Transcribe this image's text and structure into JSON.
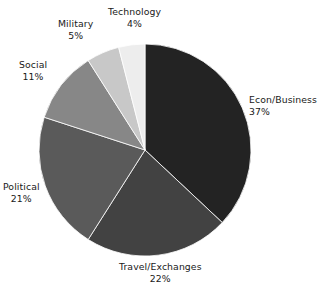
{
  "chart_data": {
    "type": "pie",
    "title": "",
    "categories": [
      "Econ/Business",
      "Travel/Exchanges",
      "Political",
      "Social",
      "Military",
      "Technology"
    ],
    "values": [
      37,
      22,
      21,
      11,
      5,
      4
    ],
    "value_suffix": "%",
    "start_angle_deg": 0,
    "direction": "clockwise",
    "legend": "none",
    "labels_position": "outside",
    "slices": [
      {
        "label": "Econ/Business",
        "value": 37,
        "value_text": "37%",
        "color": "#232323"
      },
      {
        "label": "Travel/Exchanges",
        "value": 22,
        "value_text": "22%",
        "color": "#424242"
      },
      {
        "label": "Political",
        "value": 21,
        "value_text": "21%",
        "color": "#5a5a5a"
      },
      {
        "label": "Social",
        "value": 11,
        "value_text": "11%",
        "color": "#878787"
      },
      {
        "label": "Military",
        "value": 5,
        "value_text": "5%",
        "color": "#c8c8c8"
      },
      {
        "label": "Technology",
        "value": 4,
        "value_text": "4%",
        "color": "#ededed"
      }
    ],
    "geometry": {
      "cx": 145,
      "cy": 150,
      "r": 106
    },
    "background": "#ffffff",
    "text_color": "#191919"
  }
}
